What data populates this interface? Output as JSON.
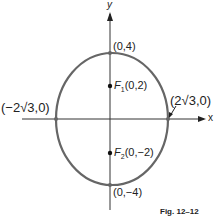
{
  "figure": {
    "caption": "Fig. 12–12",
    "axes": {
      "x_label": "x",
      "y_label": "y"
    },
    "points": {
      "top_vertex": "(0,4)",
      "bottom_vertex": "(0,−4)",
      "left_covertex": "(−2√3,0)",
      "right_covertex": "(2√3,0)",
      "focus1_letter": "F",
      "focus1_sub": "1",
      "focus1_coords": "(0,2)",
      "focus2_letter": "F",
      "focus2_sub": "2",
      "focus2_coords": "(0,−2)"
    },
    "colors": {
      "ellipse": "#666666",
      "axis": "#333333",
      "text": "#222222"
    }
  }
}
